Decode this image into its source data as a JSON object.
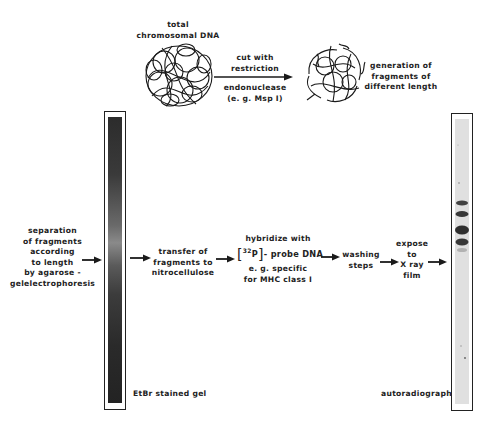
{
  "top": {
    "total_dna": [
      "total",
      "chromosomal DNA"
    ],
    "cut_above": [
      "cut with",
      "restriction"
    ],
    "cut_below": [
      "endonuclease",
      "(e. g.  Msp I)"
    ],
    "generation": [
      "generation of",
      "fragments of",
      "different length"
    ]
  },
  "steps": {
    "separation": [
      "separation",
      "of fragments",
      "according",
      "to length",
      "by agarose -",
      "gelelectrophoresis"
    ],
    "transfer": [
      "transfer of",
      "fragments to",
      "nitrocellulose"
    ],
    "hybridize_title": "hybridize with",
    "isotope": "32",
    "isotope_element": "P",
    "probe": "- probe DNA",
    "hybridize_rest": [
      "e. g.  specific",
      "for MHC class I"
    ],
    "washing": [
      "washing",
      "steps"
    ],
    "expose": [
      "expose",
      "to",
      "X ray",
      "film"
    ]
  },
  "gel": {
    "label": "EtBr stained gel",
    "color": "#2b2b2b"
  },
  "autoradiograph": {
    "label": "autoradiograph",
    "strip_color": "#e2e2e2",
    "band_color": "#262626",
    "bands_y": [
      203,
      214,
      230,
      242
    ]
  }
}
